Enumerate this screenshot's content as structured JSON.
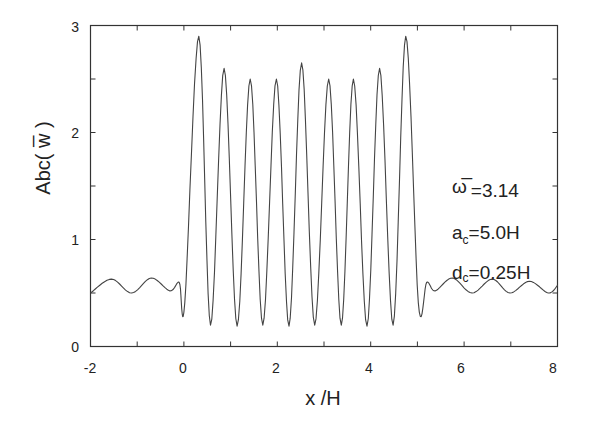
{
  "chart_data": {
    "type": "line",
    "title": "",
    "xlabel": "x /H",
    "ylabel": "Abc( w̅ )",
    "xlim": [
      -2,
      8
    ],
    "ylim": [
      0,
      3
    ],
    "grid": false,
    "legend": null,
    "x_ticks": [
      -2,
      0,
      2,
      4,
      6,
      8
    ],
    "x_minor_ticks": [
      -1,
      1,
      3,
      5,
      7
    ],
    "y_ticks": [
      0,
      1,
      2,
      3
    ],
    "y_minor_ticks": [
      0.5,
      1.5,
      2.5
    ],
    "annotations": [
      {
        "symbol": "ω̅",
        "text": "=3.14"
      },
      {
        "symbol": "a",
        "sub": "c",
        "text": "=5.0H"
      },
      {
        "symbol": "d",
        "sub": "c",
        "text": "=0.25H"
      }
    ],
    "series": [
      {
        "name": "Abc(w)",
        "color": "#444444",
        "x": [
          -2.0,
          -1.55,
          -1.12,
          -0.7,
          -0.3,
          -0.1,
          0.02,
          0.32,
          0.57,
          0.86,
          1.14,
          1.42,
          1.69,
          1.98,
          2.25,
          2.52,
          2.8,
          3.1,
          3.37,
          3.63,
          3.92,
          4.19,
          4.48,
          4.75,
          5.02,
          5.2,
          5.38,
          5.75,
          6.17,
          6.6,
          6.98,
          7.4,
          7.8,
          8.0
        ],
        "y": [
          0.5,
          0.63,
          0.5,
          0.64,
          0.52,
          0.6,
          0.41,
          2.9,
          0.2,
          2.6,
          0.19,
          2.5,
          0.2,
          2.5,
          0.19,
          2.65,
          0.2,
          2.5,
          0.2,
          2.5,
          0.19,
          2.6,
          0.2,
          2.9,
          0.41,
          0.6,
          0.52,
          0.64,
          0.5,
          0.63,
          0.5,
          0.61,
          0.5,
          0.57
        ]
      }
    ]
  },
  "labels": {
    "x_axis_title": "x /H",
    "y_axis_title": "Abc( w̅ )",
    "x_tick_labels": [
      "-2",
      "0",
      "2",
      "4",
      "6",
      "8"
    ],
    "y_tick_labels": [
      "0",
      "1",
      "2",
      "3"
    ],
    "annot_omega_symbol": "ω̅",
    "annot_omega_value": "=3.14",
    "annot_a_symbol": "a",
    "annot_a_sub": "c",
    "annot_a_value": "=5.0H",
    "annot_d_symbol": "d",
    "annot_d_sub": "c",
    "annot_d_value": "=0.25H"
  }
}
